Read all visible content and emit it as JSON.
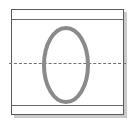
{
  "diagram": {
    "kind": "technical-drawing-thumbnail",
    "background_color": "#ffffff",
    "frame": {
      "name": "outer-plate-frame",
      "stroke_color": "#5a5a5a",
      "fill_color": "#ffffff",
      "stroke_width_px": 1,
      "x_px": 11,
      "y_px": 9,
      "width_px": 113,
      "height_px": 106,
      "shadow_color": "#c9c9c9",
      "shadow_offset_px": 3
    },
    "rails": [
      {
        "name": "top-rail",
        "orientation": "horizontal",
        "y_px": 9,
        "stroke_color": "#6a6a6a",
        "style": "solid"
      },
      {
        "name": "bottom-rail",
        "orientation": "horizontal",
        "y_px": 95,
        "stroke_color": "#6a6a6a",
        "style": "solid"
      }
    ],
    "centerline": {
      "name": "horizontal-centerline",
      "orientation": "horizontal",
      "y_px": 53,
      "stroke_color": "#707070",
      "style": "dashed",
      "dash_pattern": "5 4"
    },
    "oval": {
      "name": "oval-opening",
      "shape": "ellipse",
      "center_x_px": 66,
      "center_y_px": 65,
      "radius_x_px": 22,
      "radius_y_px": 37,
      "stroke_color": "#8a8a8a",
      "stroke_width_px": 4,
      "fill": "none"
    }
  },
  "labels": {
    "alt_text": "Rectangular plate outline with upper and lower horizontal rails, a dashed horizontal centerline, and a tall gray oval opening centered on the plate."
  }
}
